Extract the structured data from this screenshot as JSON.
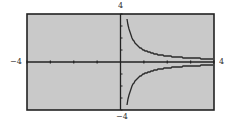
{
  "labels": {
    "y_max": "4",
    "y_min": "−4",
    "x_min": "−4",
    "x_max": "4"
  },
  "colors": {
    "screen": "#c9c9c9",
    "frame": "#222222",
    "curve": "#2a2a2a"
  },
  "chart_data": {
    "type": "line",
    "title": "",
    "xlabel": "",
    "ylabel": "",
    "xlim": [
      -4,
      4
    ],
    "ylim": [
      -4,
      4
    ],
    "x_ticks": [
      -4,
      -3,
      -2,
      -1,
      0,
      1,
      2,
      3,
      4
    ],
    "y_ticks": [
      -4,
      -3,
      -2,
      -1,
      0,
      1,
      2,
      3,
      4
    ],
    "grid": false,
    "series": [
      {
        "name": "upper branch y = 1/x (x > 0)",
        "x": [
          0.25,
          0.5,
          1,
          2,
          3,
          4
        ],
        "values": [
          4,
          2,
          1,
          0.5,
          0.33,
          0.25
        ]
      },
      {
        "name": "lower branch y = -1/x (x > 0)",
        "x": [
          0.25,
          0.5,
          1,
          2,
          3,
          4
        ],
        "values": [
          -4,
          -2,
          -1,
          -0.5,
          -0.33,
          -0.25
        ]
      }
    ]
  }
}
